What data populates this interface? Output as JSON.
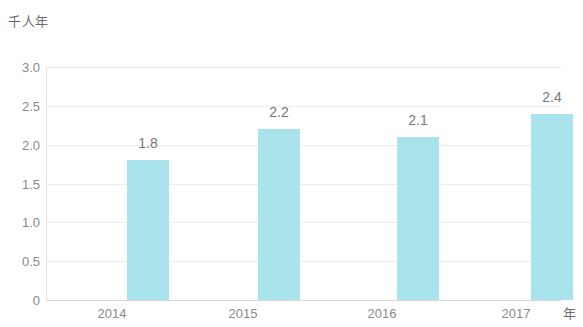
{
  "chart_data": {
    "type": "bar",
    "title": "",
    "subtitle": "",
    "xlabel": "年",
    "ylabel": "千人年",
    "categories": [
      "2014",
      "2015",
      "2016",
      "2017"
    ],
    "values": [
      1.8,
      2.2,
      2.1,
      2.4
    ],
    "data_labels": [
      "1.8",
      "2.2",
      "2.1",
      "2.4"
    ],
    "ylim": [
      0,
      3.0
    ],
    "y_ticks": [
      "3.0",
      "2.5",
      "2.0",
      "1.5",
      "1.0",
      "0.5",
      "0"
    ],
    "y_tick_values": [
      3.0,
      2.5,
      2.0,
      1.5,
      1.0,
      0.5,
      0
    ],
    "grid": true,
    "legend": false,
    "legend_position": "none",
    "series": [
      {
        "name": "千人年",
        "values": [
          1.8,
          2.2,
          2.1,
          2.4
        ],
        "color": "#a9e4ec"
      }
    ],
    "colors": {
      "bar": "#a9e4ec",
      "gridline": "#ededed",
      "axis": "#d8d8d8",
      "tick_text": "#8a8a8a",
      "label_text": "#777777",
      "background": "#ffffff"
    }
  }
}
